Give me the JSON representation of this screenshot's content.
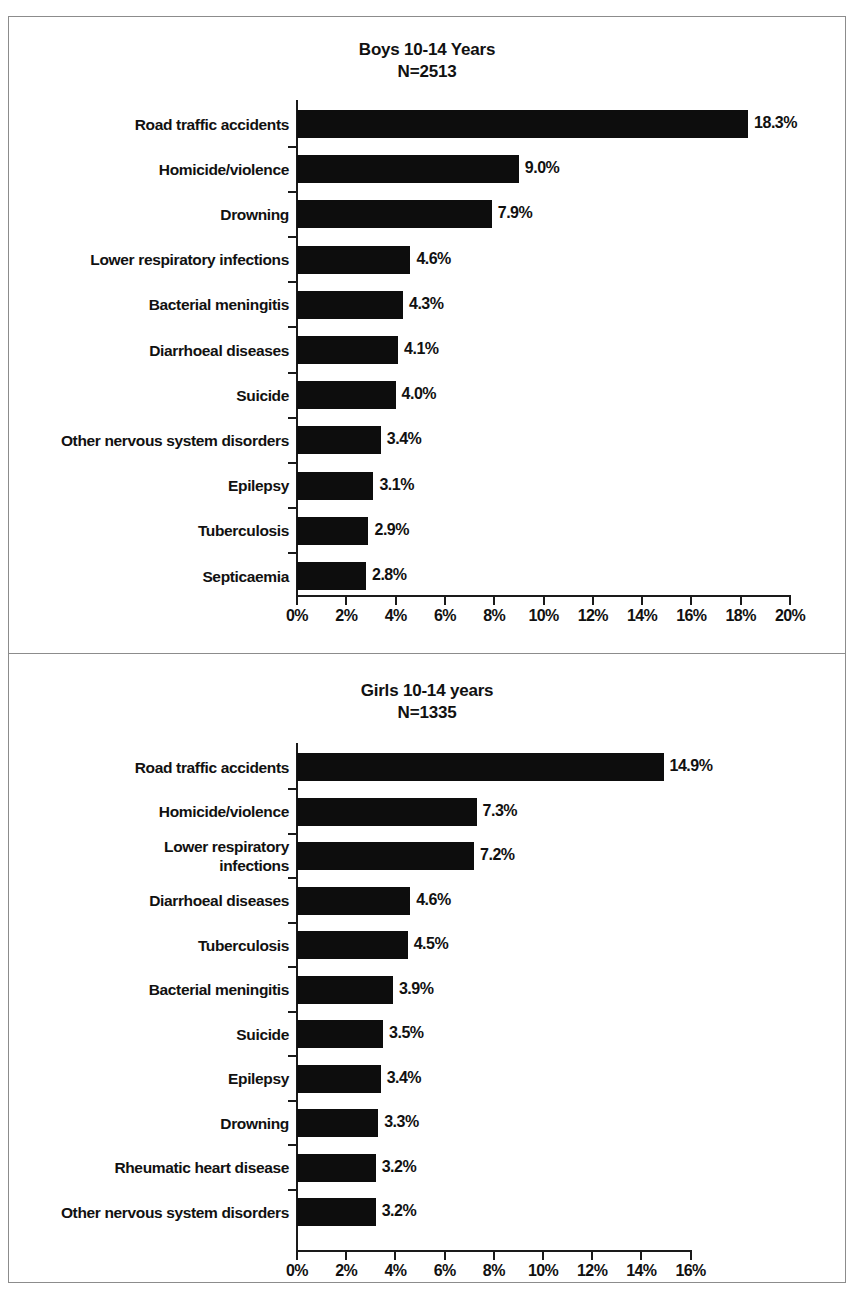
{
  "figure": {
    "background_color": "#ffffff",
    "frame_color": "#8c8c8c",
    "bar_color": "#0d0d0d",
    "text_color": "#111111"
  },
  "chart_data": [
    {
      "type": "bar",
      "orientation": "horizontal",
      "title": "Boys 10-14 Years",
      "subtitle": "N=2513",
      "xlabel": "",
      "ylabel": "",
      "xlim": [
        0,
        20
      ],
      "xticks": [
        0,
        2,
        4,
        6,
        8,
        10,
        12,
        14,
        16,
        18,
        20
      ],
      "xticklabels": [
        "0%",
        "2%",
        "4%",
        "6%",
        "8%",
        "10%",
        "12%",
        "14%",
        "16%",
        "18%",
        "20%"
      ],
      "grid": false,
      "legend": null,
      "categories": [
        "Road traffic accidents",
        "Homicide/violence",
        "Drowning",
        "Lower respiratory infections",
        "Bacterial meningitis",
        "Diarrhoeal diseases",
        "Suicide",
        "Other nervous system disorders",
        "Epilepsy",
        "Tuberculosis",
        "Septicaemia"
      ],
      "values": [
        18.3,
        9.0,
        7.9,
        4.6,
        4.3,
        4.1,
        4.0,
        3.4,
        3.1,
        2.9,
        2.8
      ],
      "value_labels": [
        "18.3%",
        "9.0%",
        "7.9%",
        "4.6%",
        "4.3%",
        "4.1%",
        "4.0%",
        "3.4%",
        "3.1%",
        "2.9%",
        "2.8%"
      ]
    },
    {
      "type": "bar",
      "orientation": "horizontal",
      "title": "Girls 10-14 years",
      "subtitle": "N=1335",
      "xlabel": "",
      "ylabel": "",
      "xlim": [
        0,
        16
      ],
      "xticks": [
        0,
        2,
        4,
        6,
        8,
        10,
        12,
        14,
        16
      ],
      "xticklabels": [
        "0%",
        "2%",
        "4%",
        "6%",
        "8%",
        "10%",
        "12%",
        "14%",
        "16%"
      ],
      "grid": false,
      "legend": null,
      "categories": [
        "Road traffic accidents",
        "Homicide/violence",
        "Lower respiratory\ninfections",
        "Diarrhoeal diseases",
        "Tuberculosis",
        "Bacterial meningitis",
        "Suicide",
        "Epilepsy",
        "Drowning",
        "Rheumatic heart disease",
        "Other nervous system disorders"
      ],
      "values": [
        14.9,
        7.3,
        7.2,
        4.6,
        4.5,
        3.9,
        3.5,
        3.4,
        3.3,
        3.2,
        3.2
      ],
      "value_labels": [
        "14.9%",
        "7.3%",
        "7.2%",
        "4.6%",
        "4.5%",
        "3.9%",
        "3.5%",
        "3.4%",
        "3.3%",
        "3.2%",
        "3.2%"
      ]
    }
  ]
}
